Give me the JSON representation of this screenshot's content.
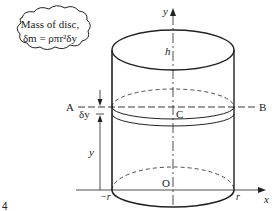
{
  "figure_number": "4",
  "callout": {
    "line1": "Mass of disc,",
    "line2": "δm = ρπr²δy"
  },
  "labels": {
    "y_axis": "y",
    "x_axis": "x",
    "height": "h",
    "point_A": "A",
    "point_B": "B",
    "point_C": "C",
    "origin": "O",
    "neg_radius": "−r",
    "pos_radius": "r",
    "disc_thickness": "δy",
    "disc_height": "y"
  },
  "colors": {
    "line": "#222222",
    "background": "#ffffff"
  }
}
